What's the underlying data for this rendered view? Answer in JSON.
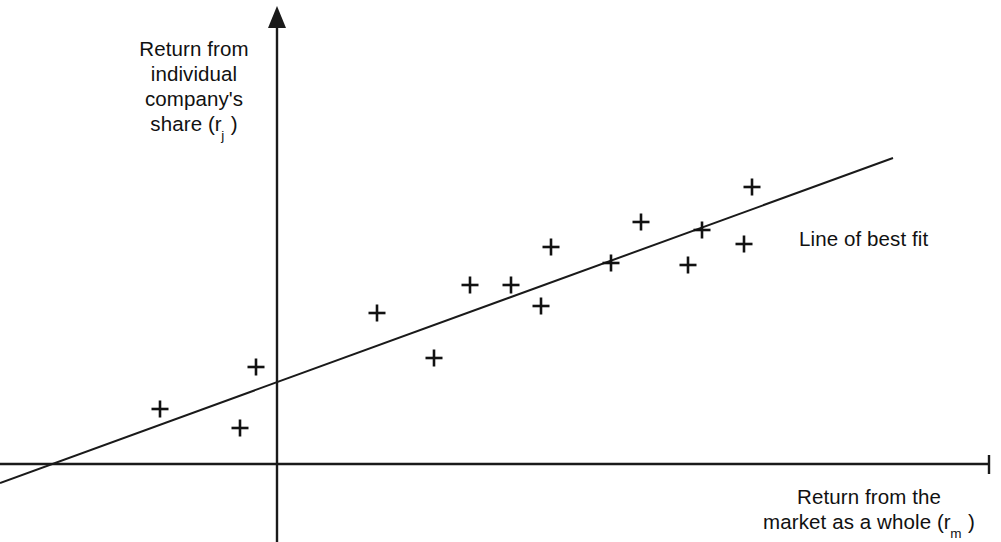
{
  "figure": {
    "kind": "scatter-diagram",
    "background_color": "#ffffff",
    "ink_color": "#1a1a1a"
  },
  "labels": {
    "y_axis_line1": "Return from",
    "y_axis_line2": "individual",
    "y_axis_line3": "company's",
    "y_axis_line4_prefix": "share (r",
    "y_axis_line4_subscript": "j",
    "y_axis_line4_suffix": " )",
    "x_axis_line1": "Return from the",
    "x_axis_line2_prefix": "market as a whole (r",
    "x_axis_line2_subscript": "m",
    "x_axis_line2_suffix": " )",
    "best_fit_annotation": "Line of best fit"
  },
  "chart_data": {
    "type": "scatter",
    "title": "",
    "xlabel": "Return from the market as a whole (r_m)",
    "ylabel": "Return from individual company's share (r_j)",
    "grid": false,
    "legend_position": "none",
    "axes": {
      "origin_px": [
        277,
        464
      ],
      "y_axis_top_px": 8,
      "y_axis_bottom_px": 542,
      "x_axis_left_px": 0,
      "x_axis_right_px": 990,
      "y_axis_arrowhead": true,
      "x_axis_end_tick": true,
      "axis_color": "#1a1a1a",
      "axis_width_px": 2.4
    },
    "trendline": {
      "name": "Line of best fit",
      "x_start_px": 0,
      "y_start_px": 483,
      "x_end_px": 893,
      "y_end_px": 158,
      "crosses_x_axis_at_px": [
        70,
        464
      ],
      "color": "#1a1a1a",
      "width_px": 2
    },
    "marker": {
      "shape": "plus",
      "size_px": 17,
      "stroke_px": 2.6,
      "color": "#111111"
    },
    "points_px": [
      [
        160,
        409
      ],
      [
        240,
        428
      ],
      [
        256,
        367
      ],
      [
        377,
        313
      ],
      [
        434,
        358
      ],
      [
        470,
        285
      ],
      [
        511,
        285
      ],
      [
        541,
        306
      ],
      [
        551,
        247
      ],
      [
        611,
        263
      ],
      [
        641,
        222
      ],
      [
        688,
        265
      ],
      [
        702,
        230
      ],
      [
        744,
        244
      ],
      [
        752,
        187
      ]
    ],
    "n_points": 15,
    "relationship": "positive linear correlation"
  }
}
